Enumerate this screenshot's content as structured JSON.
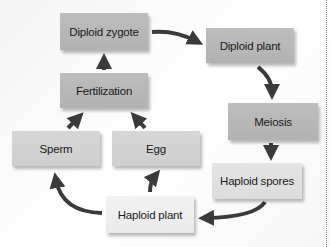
{
  "diagram": {
    "nodes": [
      {
        "id": "diploid_zygote",
        "label": "Diploid zygote"
      },
      {
        "id": "diploid_plant",
        "label": "Diploid plant"
      },
      {
        "id": "meiosis",
        "label": "Meiosis"
      },
      {
        "id": "haploid_spores",
        "label": "Haploid spores"
      },
      {
        "id": "haploid_plant",
        "label": "Haploid plant"
      },
      {
        "id": "sperm",
        "label": "Sperm"
      },
      {
        "id": "egg",
        "label": "Egg"
      },
      {
        "id": "fertilization",
        "label": "Fertilization"
      }
    ],
    "edges": [
      {
        "from": "diploid_zygote",
        "to": "diploid_plant"
      },
      {
        "from": "diploid_plant",
        "to": "meiosis"
      },
      {
        "from": "meiosis",
        "to": "haploid_spores"
      },
      {
        "from": "haploid_spores",
        "to": "haploid_plant"
      },
      {
        "from": "haploid_plant",
        "to": "sperm"
      },
      {
        "from": "haploid_plant",
        "to": "egg"
      },
      {
        "from": "sperm",
        "to": "fertilization"
      },
      {
        "from": "egg",
        "to": "fertilization"
      },
      {
        "from": "fertilization",
        "to": "diploid_zygote"
      }
    ],
    "colors": {
      "arrow": "#3a3a3a",
      "box_dark": "#b8b8b8",
      "box_mid": "#d3d3d3",
      "box_light": "#e0e0e0",
      "box_lightest": "#eeeeee"
    }
  }
}
